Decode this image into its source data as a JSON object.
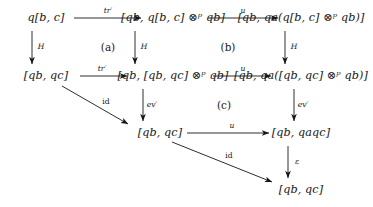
{
  "diagram": {
    "kind": "commutative-diagram",
    "nodes": [
      {
        "id": "n00",
        "label": "q[b, c]",
        "x": 46,
        "y": 18
      },
      {
        "id": "n01",
        "label": "[qb, q[b, c] ⊗ᵖ qb]",
        "x": 173,
        "y": 18
      },
      {
        "id": "n02",
        "label": "[qb, qa(q[b, c] ⊗ᵖ qb)]",
        "x": 301,
        "y": 18
      },
      {
        "id": "n10",
        "label": "[qb, qc]",
        "x": 46,
        "y": 76
      },
      {
        "id": "n11",
        "label": "[qb, [qb, qc] ⊗ᵖ qb]",
        "x": 173,
        "y": 76
      },
      {
        "id": "n12",
        "label": "[qb, qa([qb, qc] ⊗ᵖ qb)]",
        "x": 301,
        "y": 76
      },
      {
        "id": "n21",
        "label": "[qb, qc]",
        "x": 160,
        "y": 133
      },
      {
        "id": "n22",
        "label": "[qb, qaqc]",
        "x": 301,
        "y": 133
      },
      {
        "id": "n32",
        "label": "[qb, qc]",
        "x": 301,
        "y": 190
      }
    ],
    "arrows": [
      {
        "id": "a-top-left",
        "from": "n00",
        "to": "n01",
        "label": "tr′",
        "style": "italic",
        "label_x": 108,
        "label_y": 11
      },
      {
        "id": "a-top-right",
        "from": "n01",
        "to": "n02",
        "label": "u",
        "style": "italic",
        "label_x": 243,
        "label_y": 11
      },
      {
        "id": "a-mid-left",
        "from": "n10",
        "to": "n11",
        "label": "tr′",
        "style": "italic",
        "label_x": 102,
        "label_y": 69
      },
      {
        "id": "a-mid-right",
        "from": "n11",
        "to": "n12",
        "label": "u",
        "style": "italic",
        "label_x": 243,
        "label_y": 69
      },
      {
        "id": "a-row3",
        "from": "n21",
        "to": "n22",
        "label": "u",
        "style": "italic",
        "label_x": 232,
        "label_y": 126
      },
      {
        "id": "a-v-left-top",
        "from": "n00",
        "to": "n10",
        "label": "H",
        "style": "italic",
        "label_x": 41,
        "label_y": 47
      },
      {
        "id": "a-v-mid-top",
        "from": "n01",
        "to": "n11",
        "label": "H",
        "style": "italic",
        "label_x": 144,
        "label_y": 47
      },
      {
        "id": "a-v-right-top",
        "from": "n02",
        "to": "n12",
        "label": "H",
        "style": "italic",
        "label_x": 294,
        "label_y": 47
      },
      {
        "id": "a-v-mid-bot",
        "from": "n11",
        "to": "n21",
        "label": "ev′",
        "style": "italic",
        "label_x": 152,
        "label_y": 105
      },
      {
        "id": "a-v-right-bot",
        "from": "n12",
        "to": "n22",
        "label": "ev′",
        "style": "italic",
        "label_x": 303,
        "label_y": 105
      },
      {
        "id": "a-v-eps",
        "from": "n22",
        "to": "n32",
        "label": "ε",
        "style": "italic",
        "label_x": 297,
        "label_y": 162
      },
      {
        "id": "a-diag-1",
        "from": "n10",
        "to": "n21",
        "label": "id",
        "style": "upright",
        "label_x": 106,
        "label_y": 102
      },
      {
        "id": "a-diag-2",
        "from": "n21",
        "to": "n32",
        "label": "id",
        "style": "upright",
        "label_x": 229,
        "label_y": 156
      }
    ],
    "cells": [
      {
        "id": "cell-a",
        "label": "(a)",
        "x": 108,
        "y": 47
      },
      {
        "id": "cell-b",
        "label": "(b)",
        "x": 228,
        "y": 47
      },
      {
        "id": "cell-c",
        "label": "(c)",
        "x": 224,
        "y": 105
      }
    ],
    "colors": {
      "ink": "#161616",
      "background": "#ffffff"
    }
  }
}
